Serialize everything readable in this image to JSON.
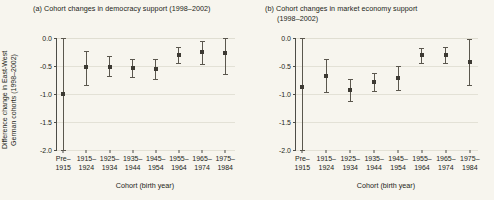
{
  "figure": {
    "background": "#f7f5ee",
    "axis_color": "#4d4d47",
    "grid_color": "#e3e1d6",
    "marker_color": "#3d3a33",
    "errorbar_color": "#5b574e",
    "y_axis_label_line1": "Difference change in East-West",
    "y_axis_label_line2": "German cohorts (1998–2002)",
    "x_axis_title": "Cohort (birth year)"
  },
  "chart_data": [
    {
      "type": "scatter",
      "panel": "a",
      "title": "(a) Cohort changes in democracy support (1998–2002)",
      "title_lines": [
        "(a) Cohort changes in democracy support (1998–2002)"
      ],
      "xlabel": "Cohort (birth year)",
      "ylabel": "Difference change in East-West German cohorts (1998–2002)",
      "ylim": [
        -2.0,
        0.0
      ],
      "yticks": [
        0.0,
        -0.5,
        -1.0,
        -1.5,
        -2.0
      ],
      "ytick_labels": [
        "0.0",
        "-0.5",
        "-1.0",
        "-1.5",
        "-2.0"
      ],
      "grid": true,
      "legend": "none",
      "categories": [
        "Pre-1915",
        "1915-1924",
        "1925-1934",
        "1935-1944",
        "1945-1954",
        "1955-1964",
        "1965-1974",
        "1975-1984"
      ],
      "category_lines": [
        [
          "Pre–",
          "1915"
        ],
        [
          "1915–",
          "1924"
        ],
        [
          "1925–",
          "1934"
        ],
        [
          "1935–",
          "1944"
        ],
        [
          "1945–",
          "1954"
        ],
        [
          "1955–",
          "1964"
        ],
        [
          "1965–",
          "1974"
        ],
        [
          "1975–",
          "1984"
        ]
      ],
      "values": [
        -1.0,
        -0.51,
        -0.51,
        -0.53,
        -0.55,
        -0.3,
        -0.25,
        -0.27
      ],
      "ci_low": [
        -2.0,
        -0.84,
        -0.68,
        -0.7,
        -0.73,
        -0.45,
        -0.46,
        -0.64
      ],
      "ci_high": [
        0.05,
        -0.23,
        -0.33,
        -0.37,
        -0.37,
        -0.16,
        -0.05,
        0.0
      ]
    },
    {
      "type": "scatter",
      "panel": "b",
      "title": "(b) Cohort changes in market economy support (1998–2002)",
      "title_lines": [
        "(b) Cohort changes in market economy support",
        "(1998–2002)"
      ],
      "xlabel": "Cohort (birth year)",
      "ylabel": "Difference change in East-West German cohorts (1998–2002)",
      "ylim": [
        -2.0,
        0.0
      ],
      "yticks": [
        0.0,
        -0.5,
        -1.0,
        -1.5,
        -2.0
      ],
      "ytick_labels": [
        "0.0",
        "-0.5",
        "-1.0",
        "-1.5",
        "-2.0"
      ],
      "grid": true,
      "legend": "none",
      "categories": [
        "Pre-1915",
        "1915-1924",
        "1925-1934",
        "1935-1944",
        "1945-1954",
        "1955-1964",
        "1965-1974",
        "1975-1984"
      ],
      "category_lines": [
        [
          "Pre–",
          "1915"
        ],
        [
          "1915–",
          "1924"
        ],
        [
          "1925–",
          "1934"
        ],
        [
          "1935–",
          "1944"
        ],
        [
          "1945–",
          "1954"
        ],
        [
          "1955–",
          "1964"
        ],
        [
          "1965–",
          "1974"
        ],
        [
          "1975–",
          "1984"
        ]
      ],
      "values": [
        -0.88,
        -0.67,
        -0.93,
        -0.79,
        -0.71,
        -0.58,
        -0.31,
        -0.3,
        -0.42
      ],
      "values_fixed": [
        -0.88,
        -0.67,
        -0.93,
        -0.79,
        -0.71,
        -0.31,
        -0.3,
        -0.42
      ],
      "ci_low": [
        -2.0,
        -0.97,
        -1.12,
        -0.95,
        -0.92,
        -0.78,
        -0.45,
        -0.44,
        -0.84
      ],
      "ci_low_fixed": [
        -2.0,
        -0.97,
        -1.12,
        -0.95,
        -0.92,
        -0.45,
        -0.44,
        -0.84
      ],
      "ci_high": [
        0.07,
        -0.37,
        -0.74,
        -0.62,
        -0.5,
        -0.38,
        -0.17,
        -0.16,
        -0.02
      ],
      "ci_high_fixed": [
        0.07,
        -0.37,
        -0.74,
        -0.62,
        -0.5,
        -0.17,
        -0.16,
        -0.02
      ]
    }
  ]
}
